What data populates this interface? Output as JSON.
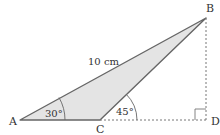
{
  "diagram": {
    "points": {
      "A": {
        "label": "A",
        "x": 20,
        "y": 120
      },
      "B": {
        "label": "B",
        "x": 206,
        "y": 18
      },
      "C": {
        "label": "C",
        "x": 100,
        "y": 120
      },
      "D": {
        "label": "D",
        "x": 206,
        "y": 120
      }
    },
    "side_AB_label": "10 cm",
    "angle_A_label": "30°",
    "angle_BCD_label": "45°",
    "colors": {
      "fill": "#e4e4e4",
      "stroke": "#666666",
      "dashed": "#777777",
      "text": "#333333"
    }
  }
}
